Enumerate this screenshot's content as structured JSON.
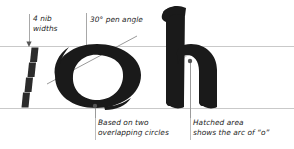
{
  "figure": {
    "type": "calligraphy-letterform-diagram",
    "background_color": "#ffffff",
    "ink_color": "#1a1a1a",
    "guide_color": "#c9c9c9",
    "leader_color": "#a8a8a8",
    "hatch_fill_color": "#c9c9c9",
    "text_color": "#1c1c1c",
    "letters_shown": [
      "o",
      "h"
    ],
    "guides": {
      "x_height_line_y": 46,
      "baseline_y": 108
    }
  },
  "annotations": {
    "nib_widths": {
      "line1": "4 nib",
      "line2": "widths",
      "value": 4,
      "unit": "nib widths",
      "pointer": "vertical-arrow-down",
      "target": "nib-width-staircase"
    },
    "pen_angle": {
      "text": "30° pen angle",
      "value": 30,
      "unit": "degrees",
      "pointer": "vertical-leader",
      "target": "pen-angle-diagonal"
    },
    "circles": {
      "line1": "Based on two",
      "line2": "overlapping circles",
      "pointer": "dot-and-stem",
      "target": "letter-o"
    },
    "hatched": {
      "line1": "Hatched area",
      "line2": "shows the arc of “o”",
      "pointer": "dot-and-stem",
      "target": "letter-h-shoulder-arc"
    }
  },
  "elements": {
    "nib_staircase": {
      "name": "nib-width-staircase",
      "block_count": 4,
      "description": "Four stacked pen-nib-width parallelograms descending to the left"
    },
    "pen_angle_line": {
      "name": "pen-angle-diagonal",
      "angle_degrees": 30
    },
    "letter_o": {
      "name": "letter-o",
      "glyph": "o"
    },
    "letter_h": {
      "name": "letter-h",
      "glyph": "h"
    }
  }
}
